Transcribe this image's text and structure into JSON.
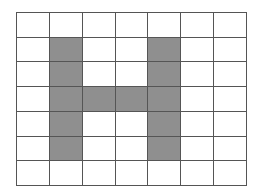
{
  "grid": {
    "rows": 7,
    "cols": 7,
    "fill_color": "#8f8f8f",
    "empty_color": "#ffffff",
    "line_color": "#555555",
    "filled_cells": [
      [
        1,
        1
      ],
      [
        2,
        1
      ],
      [
        3,
        1
      ],
      [
        4,
        1
      ],
      [
        5,
        1
      ],
      [
        1,
        4
      ],
      [
        2,
        4
      ],
      [
        3,
        4
      ],
      [
        4,
        4
      ],
      [
        5,
        4
      ],
      [
        3,
        2
      ],
      [
        3,
        3
      ]
    ],
    "shape": "H"
  }
}
